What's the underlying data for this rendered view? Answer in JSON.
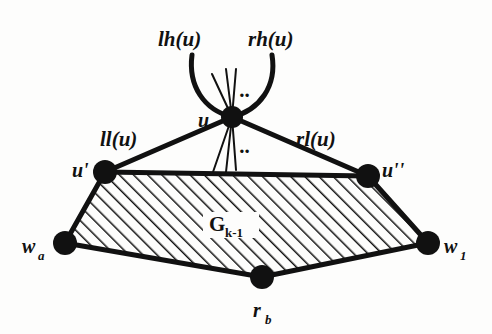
{
  "figure": {
    "kind": "undirected-graph-diagram",
    "background_color": "#fdfdfc",
    "ink_color": "#111111",
    "region_label": {
      "base": "G",
      "subscript": "k-1",
      "full": "G k-1"
    },
    "edge_labels": {
      "left_high": "lh(u)",
      "right_high": "rh(u)",
      "left_low": "ll(u)",
      "right_low": "rl(u)"
    },
    "ellipsis": {
      "upper": "..",
      "lower": ".."
    },
    "nodes": [
      {
        "id": "u",
        "label": "u",
        "subscript": "",
        "x": 232,
        "y": 117,
        "r": 11
      },
      {
        "id": "uprime",
        "label": "u'",
        "subscript": "",
        "x": 105,
        "y": 172,
        "r": 12
      },
      {
        "id": "udbl",
        "label": "u''",
        "subscript": "",
        "x": 368,
        "y": 176,
        "r": 12
      },
      {
        "id": "wa",
        "label": "w",
        "subscript": "a",
        "x": 65,
        "y": 243,
        "r": 12
      },
      {
        "id": "w1",
        "label": "w",
        "subscript": "1",
        "x": 428,
        "y": 243,
        "r": 12
      },
      {
        "id": "rb",
        "label": "r",
        "subscript": "b",
        "x": 262,
        "y": 277,
        "r": 12
      }
    ],
    "edges": [
      {
        "from": "u",
        "to": "uprime",
        "style": "thick-straight"
      },
      {
        "from": "u",
        "to": "udbl",
        "style": "thick-straight"
      },
      {
        "from": "uprime",
        "to": "udbl",
        "style": "thick-straight"
      },
      {
        "from": "uprime",
        "to": "wa",
        "style": "thick-straight"
      },
      {
        "from": "udbl",
        "to": "w1",
        "style": "thick-straight"
      },
      {
        "from": "wa",
        "to": "rb",
        "style": "thick-straight"
      },
      {
        "from": "rb",
        "to": "w1",
        "style": "thick-straight"
      }
    ],
    "pendant_arcs": [
      {
        "id": "lh-arc",
        "from": "u",
        "label": "lh(u)",
        "direction": "up-left"
      },
      {
        "id": "rh-arc",
        "from": "u",
        "label": "rh(u)",
        "direction": "up-right"
      }
    ],
    "spokes": {
      "upper_count": 3,
      "lower_count": 3,
      "style": "thin-straight"
    },
    "hatched_region": {
      "angle_deg": 45,
      "spacing_px": 10,
      "stroke_width_px": 3,
      "vertices": [
        "uprime",
        "udbl",
        "w1",
        "rb",
        "wa"
      ]
    }
  },
  "labels": {
    "lh_u": {
      "text": "lh(u)",
      "x": 158,
      "y": 46
    },
    "rh_u": {
      "text": "rh(u)",
      "x": 248,
      "y": 46
    },
    "ll_u": {
      "text": "ll(u)",
      "x": 100,
      "y": 146
    },
    "rl_u": {
      "text": "rl(u)",
      "x": 296,
      "y": 146
    },
    "u": {
      "text": "u",
      "x": 198,
      "y": 127
    },
    "u_prime": {
      "text": "u'",
      "x": 72,
      "y": 177
    },
    "u_dbl": {
      "text": "u''",
      "x": 382,
      "y": 177
    },
    "w_a": {
      "text": "w",
      "sub": "a",
      "x": 22,
      "y": 253
    },
    "w_1": {
      "text": "w",
      "sub": "1",
      "x": 444,
      "y": 253
    },
    "r_b": {
      "text": "r",
      "sub": "b",
      "x": 253,
      "y": 317
    },
    "g_k": {
      "text": "G",
      "sub": "k-1",
      "x": 209,
      "y": 231
    },
    "dots_upper": {
      "text": "..",
      "x": 240,
      "y": 97
    },
    "dots_lower": {
      "text": "..",
      "x": 240,
      "y": 153
    }
  }
}
